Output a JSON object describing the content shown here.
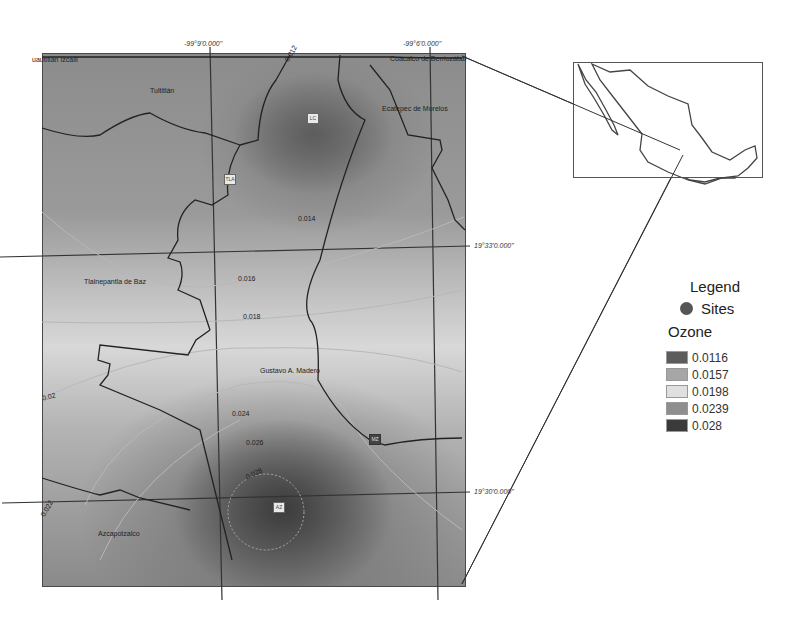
{
  "map": {
    "coordinates": {
      "lon_1": "-99°9'0.000\"",
      "lon_2": "-99°6'0.000\"",
      "lat_1": "19°33'0.000\"",
      "lat_2": "19°30'0.000\""
    },
    "place_labels": {
      "cuautitlan": "uautitlán Izcalli",
      "tultitlan": "Tultitlán",
      "coacalco": "Coacalco de Berriozábal",
      "ecatepec": "Ecatepec de Morelos",
      "tlalnepantla": "Tlalnepantla de Baz",
      "gustavo": "Gustavo A. Madero",
      "azcapotzalco": "Azcapotzalco"
    },
    "contour_labels": {
      "c012": "0.012",
      "c014": "0.014",
      "c016": "0.016",
      "c018": "0.018",
      "c02": "0.02",
      "c022": "0.022",
      "c024": "0.024",
      "c026": "0.026",
      "c028": "0.028"
    },
    "sites": {
      "s1": "LC",
      "s2": "TLA",
      "s3": "MZ",
      "s4": "AZ"
    }
  },
  "legend": {
    "title": "Legend",
    "sites_label": "Sites",
    "ozone_label": "Ozone",
    "items": [
      {
        "value": "0.0116",
        "color": "#5c5c5c"
      },
      {
        "value": "0.0157",
        "color": "#a6a6a6"
      },
      {
        "value": "0.0198",
        "color": "#e0e0e0"
      },
      {
        "value": "0.0239",
        "color": "#8e8e8e"
      },
      {
        "value": "0.028",
        "color": "#3a3a3a"
      }
    ]
  }
}
